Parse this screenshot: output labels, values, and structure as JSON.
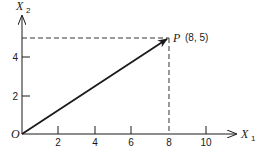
{
  "diagram": {
    "type": "vector-plot",
    "axes": {
      "x": {
        "label": "X",
        "subscript": "1",
        "ticks": [
          "2",
          "4",
          "6",
          "8",
          "10"
        ]
      },
      "y": {
        "label": "X",
        "subscript": "2",
        "ticks": [
          "2",
          "4"
        ]
      }
    },
    "origin_label": "O",
    "point": {
      "name": "P",
      "coords_label": "(8, 5)",
      "x": 8,
      "y": 5
    },
    "colors": {
      "ink": "#1a1a1a",
      "dashed": "#333333"
    }
  }
}
